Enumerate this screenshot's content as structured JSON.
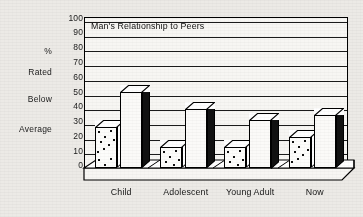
{
  "chart_data": {
    "type": "bar",
    "title": "Man's Relationship to Peers",
    "xlabel": "",
    "ylabel": "% Rated Below Average",
    "ylim": [
      0,
      100
    ],
    "yticks": [
      0,
      10,
      20,
      30,
      40,
      50,
      60,
      70,
      80,
      90,
      100
    ],
    "grid": true,
    "legend": "none",
    "style": "3d-bar",
    "categories": [
      "Child",
      "Adolescent",
      "Young Adult",
      "Now"
    ],
    "series": [
      {
        "name": "speckled",
        "fill": "speckled",
        "values": [
          28,
          14,
          14,
          21
        ]
      },
      {
        "name": "plain",
        "fill": "white",
        "values": [
          52,
          40,
          33,
          36
        ]
      }
    ]
  },
  "axis": {
    "y_tick_labels": [
      "100",
      "90",
      "80",
      "70",
      "60",
      "50",
      "40",
      "30",
      "20",
      "10",
      "0"
    ],
    "side_labels": [
      "%",
      "Rated",
      "Below",
      "Average"
    ]
  },
  "colors": {
    "background": "#eceae6",
    "plot_background": "#f7f6f3",
    "ink": "#000000",
    "bar_front": "#fbfaf8",
    "bar_side": "#111111"
  }
}
